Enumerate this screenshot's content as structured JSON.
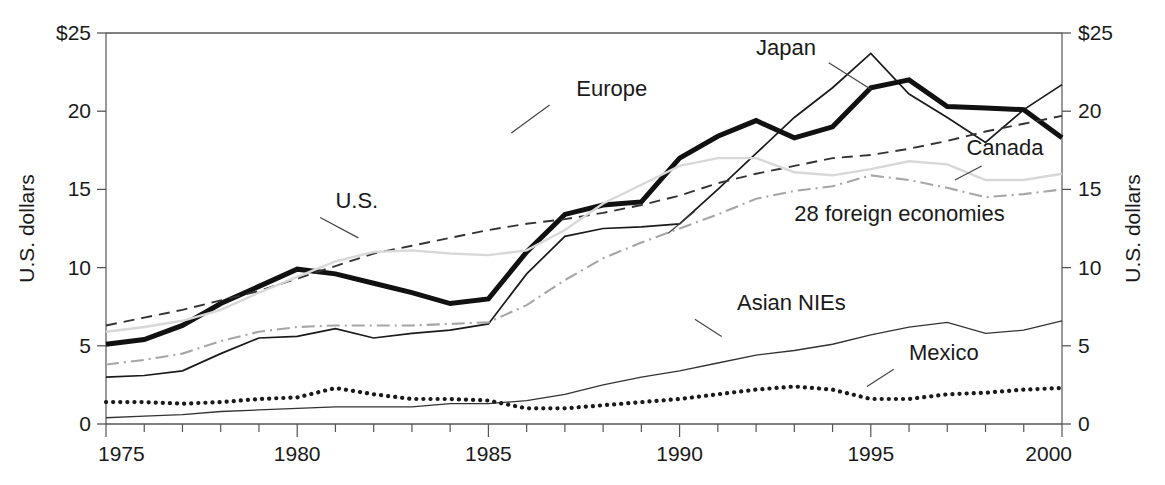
{
  "figure": {
    "top_caption_fragment": "",
    "background": "#ffffff",
    "width": 1165,
    "height": 485
  },
  "axes": {
    "left": {
      "title": "U.S. dollars",
      "ticks": [
        "$25",
        "20",
        "15",
        "10",
        "5",
        "0"
      ],
      "tick_values": [
        25,
        20,
        15,
        10,
        5,
        0
      ]
    },
    "right": {
      "title": "U.S. dollars",
      "ticks": [
        "$25",
        "20",
        "15",
        "10",
        "5",
        "0"
      ],
      "tick_values": [
        25,
        20,
        15,
        10,
        5,
        0
      ]
    },
    "bottom": {
      "ticks": [
        "1975",
        "1980",
        "1985",
        "1990",
        "1995",
        "2000"
      ],
      "tick_values": [
        1975,
        1980,
        1985,
        1990,
        1995,
        2000
      ],
      "minor_tick_step": 1
    }
  },
  "chart_data": {
    "type": "line",
    "title": "",
    "xlabel": "",
    "ylabel": "U.S. dollars",
    "xlim": [
      1975,
      2000
    ],
    "ylim": [
      0,
      25
    ],
    "grid": false,
    "legend": "inline-labels",
    "x": [
      1975,
      1976,
      1977,
      1978,
      1979,
      1980,
      1981,
      1982,
      1983,
      1984,
      1985,
      1986,
      1987,
      1988,
      1989,
      1990,
      1991,
      1992,
      1993,
      1994,
      1995,
      1996,
      1997,
      1998,
      1999,
      2000
    ],
    "series": [
      {
        "name": "Japan",
        "style": "solid-thin",
        "color": "#1a1a1a",
        "label_text": "Japan",
        "values": [
          3.0,
          3.1,
          3.4,
          4.5,
          5.5,
          5.6,
          6.1,
          5.5,
          5.8,
          6.0,
          6.4,
          9.6,
          12.0,
          12.5,
          12.6,
          12.8,
          15.0,
          17.3,
          19.6,
          21.5,
          23.7,
          21.1,
          19.6,
          18.0,
          20.1,
          21.7
        ]
      },
      {
        "name": "Europe",
        "style": "solid-thick",
        "color": "#111111",
        "label_text": "Europe",
        "values": [
          5.1,
          5.4,
          6.3,
          7.7,
          8.8,
          9.9,
          9.6,
          9.0,
          8.4,
          7.7,
          8.0,
          11.0,
          13.4,
          14.0,
          14.2,
          17.0,
          18.4,
          19.4,
          18.3,
          19.0,
          21.5,
          22.0,
          20.3,
          20.2,
          20.1,
          18.3
        ]
      },
      {
        "name": "U.S.",
        "style": "dashed",
        "color": "#333333",
        "label_text": "U.S.",
        "values": [
          6.3,
          6.8,
          7.3,
          7.9,
          8.5,
          9.3,
          10.1,
          10.9,
          11.4,
          11.9,
          12.4,
          12.8,
          13.1,
          13.5,
          14.0,
          14.6,
          15.4,
          16.0,
          16.5,
          17.0,
          17.2,
          17.6,
          18.1,
          18.7,
          19.2,
          19.7
        ]
      },
      {
        "name": "Canada",
        "style": "solid-light",
        "color": "#d8d8d8",
        "label_text": "Canada",
        "values": [
          5.9,
          6.2,
          6.6,
          7.3,
          8.4,
          9.4,
          10.4,
          11.0,
          11.1,
          10.9,
          10.8,
          11.1,
          12.4,
          14.1,
          15.3,
          16.5,
          17.0,
          17.0,
          16.1,
          15.9,
          16.3,
          16.8,
          16.6,
          15.6,
          15.6,
          16.0
        ]
      },
      {
        "name": "28 foreign economies",
        "style": "dashdot",
        "color": "#a6a6a6",
        "label_text": "28 foreign economies",
        "values": [
          3.8,
          4.1,
          4.5,
          5.3,
          5.9,
          6.2,
          6.3,
          6.3,
          6.3,
          6.4,
          6.5,
          7.6,
          9.2,
          10.6,
          11.6,
          12.5,
          13.4,
          14.4,
          14.9,
          15.2,
          15.9,
          15.6,
          15.1,
          14.5,
          14.7,
          15.0
        ]
      },
      {
        "name": "Asian NIEs",
        "style": "solid-hairline",
        "color": "#333333",
        "label_text": "Asian NIEs",
        "values": [
          0.4,
          0.5,
          0.6,
          0.8,
          0.9,
          1.0,
          1.1,
          1.1,
          1.1,
          1.3,
          1.3,
          1.5,
          1.9,
          2.5,
          3.0,
          3.4,
          3.9,
          4.4,
          4.7,
          5.1,
          5.7,
          6.2,
          6.5,
          5.8,
          6.0,
          6.6
        ]
      },
      {
        "name": "Mexico",
        "style": "dotted",
        "color": "#1a1a1a",
        "label_text": "Mexico",
        "values": [
          1.4,
          1.4,
          1.3,
          1.4,
          1.6,
          1.7,
          2.3,
          1.9,
          1.6,
          1.6,
          1.5,
          1.0,
          1.0,
          1.2,
          1.4,
          1.6,
          1.9,
          2.2,
          2.4,
          2.2,
          1.6,
          1.6,
          1.9,
          2.0,
          2.2,
          2.3
        ]
      }
    ],
    "annotations": [
      {
        "text": "Japan",
        "x": 1992.0,
        "y": 23.6
      },
      {
        "text": "Europe",
        "x": 1987.3,
        "y": 21.0
      },
      {
        "text": "U.S.",
        "x": 1981.0,
        "y": 13.8
      },
      {
        "text": "Canada",
        "x": 1997.5,
        "y": 17.2
      },
      {
        "text": "28 foreign economies",
        "x": 1993.0,
        "y": 13.0
      },
      {
        "text": "Asian NIEs",
        "x": 1991.5,
        "y": 7.3
      },
      {
        "text": "Mexico",
        "x": 1996.0,
        "y": 4.1
      }
    ]
  }
}
